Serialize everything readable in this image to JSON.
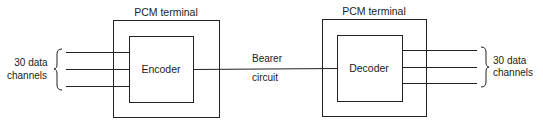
{
  "diagram": {
    "left_terminal": {
      "title": "PCM terminal",
      "block": "Encoder"
    },
    "right_terminal": {
      "title": "PCM terminal",
      "block": "Decoder"
    },
    "link": {
      "label_top": "Bearer",
      "label_bottom": "circuit"
    },
    "left_channels": {
      "line1": "30 data",
      "line2": "channels"
    },
    "right_channels": {
      "line1": "30 data",
      "line2": "channels"
    }
  },
  "colors": {
    "stroke": "#222222",
    "background": "#ffffff"
  }
}
